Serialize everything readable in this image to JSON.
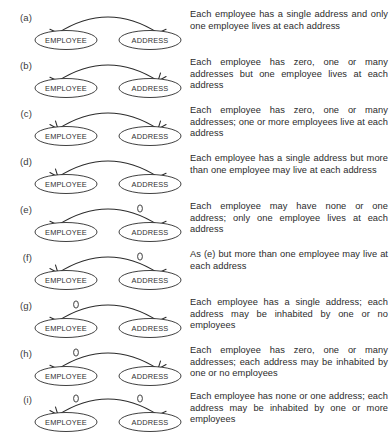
{
  "figure": {
    "entities": {
      "left": "EMPLOYEE",
      "right": "ADDRESS"
    },
    "ink_color": "#2b2b2b",
    "background": "#ffffff",
    "rows": [
      {
        "label": "(a)",
        "left_entity": "EMPLOYEE",
        "right_entity": "ADDRESS",
        "description": "Each employee has a single address and only one employee lives at each address",
        "left_end": {
          "arrow": "single",
          "optional_circle": false
        },
        "right_end": {
          "arrow": "single",
          "optional_circle": false
        }
      },
      {
        "label": "(b)",
        "left_entity": "EMPLOYEE",
        "right_entity": "ADDRESS",
        "description": "Each employee has zero, one or many addresses but one employee lives at each address",
        "left_end": {
          "arrow": "single",
          "optional_circle": false
        },
        "right_end": {
          "arrow": "crow",
          "optional_circle": false
        }
      },
      {
        "label": "(c)",
        "left_entity": "EMPLOYEE",
        "right_entity": "ADDRESS",
        "description": "Each employee has zero, one or many addresses; one or more employees live at each address",
        "left_end": {
          "arrow": "crow",
          "optional_circle": false
        },
        "right_end": {
          "arrow": "crow",
          "optional_circle": false
        }
      },
      {
        "label": "(d)",
        "left_entity": "EMPLOYEE",
        "right_entity": "ADDRESS",
        "description": "Each employee has a single address but more than one employee may live at each address",
        "left_end": {
          "arrow": "crow",
          "optional_circle": false
        },
        "right_end": {
          "arrow": "single",
          "optional_circle": false
        }
      },
      {
        "label": "(e)",
        "left_entity": "EMPLOYEE",
        "right_entity": "ADDRESS",
        "description": "Each employee may have none or one address; only one employee lives at each address",
        "left_end": {
          "arrow": "single",
          "optional_circle": false
        },
        "right_end": {
          "arrow": "single",
          "optional_circle": true
        }
      },
      {
        "label": "(f)",
        "left_entity": "EMPLOYEE",
        "right_entity": "ADDRESS",
        "description": "As (e) but more than one employee may live at each address",
        "left_end": {
          "arrow": "crow",
          "optional_circle": false
        },
        "right_end": {
          "arrow": "single",
          "optional_circle": true
        }
      },
      {
        "label": "(g)",
        "left_entity": "EMPLOYEE",
        "right_entity": "ADDRESS",
        "description": "Each employee has a single address; each address may be inhabited by one or no employees",
        "left_end": {
          "arrow": "single",
          "optional_circle": true
        },
        "right_end": {
          "arrow": "single",
          "optional_circle": false
        }
      },
      {
        "label": "(h)",
        "left_entity": "EMPLOYEE",
        "right_entity": "ADDRESS",
        "description": "Each employee has zero, one or many addresses; each address may be inhabited by one or no employees",
        "left_end": {
          "arrow": "single",
          "optional_circle": true
        },
        "right_end": {
          "arrow": "crow",
          "optional_circle": false
        }
      },
      {
        "label": "(i)",
        "left_entity": "EMPLOYEE",
        "right_entity": "ADDRESS",
        "description": "Each employee has none or one address; each address may be inhabited by one or more employees",
        "left_end": {
          "arrow": "crow",
          "optional_circle": true
        },
        "right_end": {
          "arrow": "single",
          "optional_circle": true
        }
      }
    ]
  }
}
